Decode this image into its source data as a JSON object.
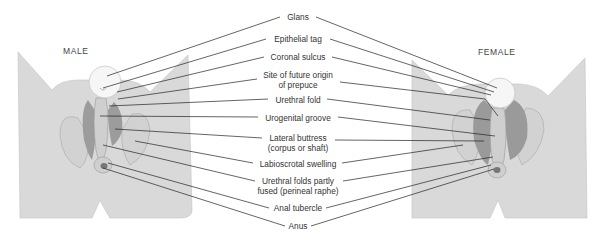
{
  "figure": {
    "left_title": "MALE",
    "right_title": "FEMALE",
    "colors": {
      "skin": "#d9d9d9",
      "skin_edge": "#b8b8b8",
      "glans": "#f6f6f6",
      "dark_fold": "#9a9a9a",
      "leader": "#222222"
    }
  },
  "labels": [
    {
      "id": "glans",
      "text": "Glans",
      "x": 298,
      "y": 14
    },
    {
      "id": "epithelial-tag",
      "text": "Epithelial tag",
      "x": 298,
      "y": 36
    },
    {
      "id": "coronal-sulcus",
      "text": "Coronal sulcus",
      "x": 298,
      "y": 54
    },
    {
      "id": "site-prepuce",
      "text": "Site of future origin",
      "x": 298,
      "y": 71
    },
    {
      "id": "site-prepuce-2",
      "text": "of prepuce",
      "x": 298,
      "y": 81
    },
    {
      "id": "urethral-fold",
      "text": "Urethral fold",
      "x": 298,
      "y": 96
    },
    {
      "id": "urogenital-groove",
      "text": "Urogenital groove",
      "x": 298,
      "y": 114
    },
    {
      "id": "lateral-buttress",
      "text": "Lateral buttress",
      "x": 298,
      "y": 134
    },
    {
      "id": "lateral-buttress-2",
      "text": "(corpus or shaft)",
      "x": 298,
      "y": 144
    },
    {
      "id": "labioscrotal-swelling",
      "text": "Labioscrotal swelling",
      "x": 298,
      "y": 160
    },
    {
      "id": "urethral-folds-fused",
      "text": "Urethral folds partly",
      "x": 298,
      "y": 177
    },
    {
      "id": "urethral-folds-fused-2",
      "text": "fused (perineal raphe)",
      "x": 298,
      "y": 188
    },
    {
      "id": "anal-tubercle",
      "text": "Anal tubercle",
      "x": 298,
      "y": 204
    },
    {
      "id": "anus",
      "text": "Anus",
      "x": 298,
      "y": 222
    }
  ]
}
